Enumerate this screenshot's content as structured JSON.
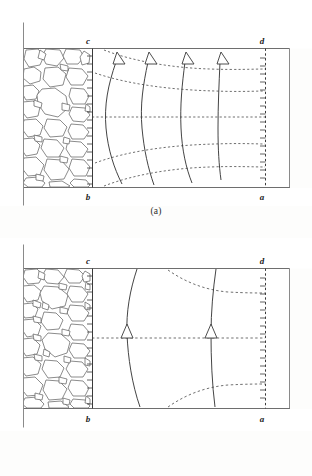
{
  "figure": {
    "type": "diagram",
    "colors": {
      "frame": "#8a8a8a",
      "domain_line": "#6e6e6e",
      "flow_line": "#3a3a3a",
      "equipotential_line": "#555555",
      "rock_outline": "#5a5a5a",
      "background": "#ffffff",
      "label_text": "#222222"
    }
  },
  "panels": [
    {
      "id": "a",
      "caption": "(a)",
      "labels": {
        "top_left": "c",
        "top_right": "d",
        "bottom_left": "b",
        "bottom_right": "a"
      },
      "rockfill": {
        "name": "gravel-rockfill-zone",
        "description": "packed irregular rounded stones",
        "stone_count": 34,
        "density": "coarse"
      },
      "flow_lines": {
        "count": 4,
        "style": "solid",
        "arrow_position": "top",
        "arrow_style": "open-triangle",
        "direction": "upward"
      },
      "equipotential_lines": {
        "count": 5,
        "style": "dashed",
        "middle_is_horizontal": true
      },
      "boundaries": {
        "left_vertical": {
          "label_top": "c",
          "label_bottom": "b",
          "style": "solid-with-ticks"
        },
        "right_vertical": {
          "label_top": "d",
          "label_bottom": "a",
          "style": "dashed-with-ticks"
        }
      }
    },
    {
      "id": "b",
      "caption": "(b)",
      "labels": {
        "top_left": "c",
        "top_right": "d",
        "bottom_left": "b",
        "bottom_right": "a"
      },
      "rockfill": {
        "name": "gravel-rockfill-zone",
        "description": "densely packed irregular stones",
        "stone_count": 42,
        "density": "fine"
      },
      "flow_lines": {
        "count": 2,
        "style": "solid",
        "arrow_position": "middle",
        "arrow_style": "open-triangle",
        "direction": "upward"
      },
      "equipotential_lines": {
        "count": 3,
        "style": "dashed",
        "middle_is_horizontal": true
      },
      "boundaries": {
        "left_vertical": {
          "label_top": "c",
          "label_bottom": "b",
          "style": "solid-with-ticks"
        },
        "right_vertical": {
          "label_top": "d",
          "label_bottom": "a",
          "style": "dashed-with-ticks"
        }
      }
    }
  ]
}
